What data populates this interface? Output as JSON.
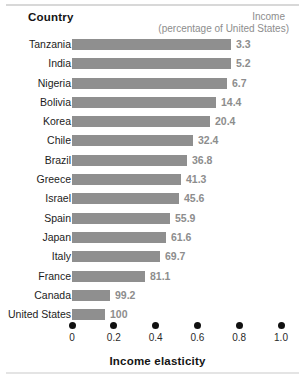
{
  "header": {
    "country_label": "Country",
    "income_label": "Income",
    "income_sublabel": "(percentage of United States)"
  },
  "axis": {
    "title": "Income elasticity",
    "ticks": [
      "0",
      "0.2",
      "0.4",
      "0.6",
      "0.8",
      "1.0"
    ]
  },
  "colors": {
    "bar": "#8f8f8f",
    "value_text": "#8d8d8d",
    "label_text": "#1c1c1c",
    "tick_dot": "#111111",
    "rule": "#d8d8d8"
  },
  "chart_data": {
    "type": "bar",
    "title": "",
    "orientation": "horizontal",
    "xlabel": "Income elasticity",
    "ylabel": "Country",
    "xlim": [
      0,
      1.0
    ],
    "xticks": [
      0,
      0.2,
      0.4,
      0.6,
      0.8,
      1.0
    ],
    "grid": false,
    "legend": "none",
    "value_column_header": "Income (percentage of United States)",
    "categories": [
      "Tanzania",
      "India",
      "Nigeria",
      "Bolivia",
      "Korea",
      "Chile",
      "Brazil",
      "Greece",
      "Israel",
      "Spain",
      "Japan",
      "Italy",
      "France",
      "Canada",
      "United States"
    ],
    "series": [
      {
        "name": "Income elasticity",
        "values": [
          0.76,
          0.76,
          0.74,
          0.69,
          0.66,
          0.58,
          0.55,
          0.52,
          0.51,
          0.47,
          0.45,
          0.42,
          0.35,
          0.18,
          0.16
        ]
      }
    ],
    "annotations": {
      "name": "Income (percentage of United States)",
      "values": [
        3.3,
        5.2,
        6.7,
        14.4,
        20.4,
        32.4,
        36.8,
        41.3,
        45.6,
        55.9,
        61.6,
        69.7,
        81.1,
        99.2,
        100
      ]
    },
    "rows": [
      {
        "country": "Tanzania",
        "elasticity": 0.76,
        "income_pct": "3.3"
      },
      {
        "country": "India",
        "elasticity": 0.76,
        "income_pct": "5.2"
      },
      {
        "country": "Nigeria",
        "elasticity": 0.74,
        "income_pct": "6.7"
      },
      {
        "country": "Bolivia",
        "elasticity": 0.69,
        "income_pct": "14.4"
      },
      {
        "country": "Korea",
        "elasticity": 0.66,
        "income_pct": "20.4"
      },
      {
        "country": "Chile",
        "elasticity": 0.58,
        "income_pct": "32.4"
      },
      {
        "country": "Brazil",
        "elasticity": 0.55,
        "income_pct": "36.8"
      },
      {
        "country": "Greece",
        "elasticity": 0.52,
        "income_pct": "41.3"
      },
      {
        "country": "Israel",
        "elasticity": 0.51,
        "income_pct": "45.6"
      },
      {
        "country": "Spain",
        "elasticity": 0.47,
        "income_pct": "55.9"
      },
      {
        "country": "Japan",
        "elasticity": 0.45,
        "income_pct": "61.6"
      },
      {
        "country": "Italy",
        "elasticity": 0.42,
        "income_pct": "69.7"
      },
      {
        "country": "France",
        "elasticity": 0.35,
        "income_pct": "81.1"
      },
      {
        "country": "Canada",
        "elasticity": 0.18,
        "income_pct": "99.2"
      },
      {
        "country": "United States",
        "elasticity": 0.16,
        "income_pct": "100"
      }
    ]
  }
}
